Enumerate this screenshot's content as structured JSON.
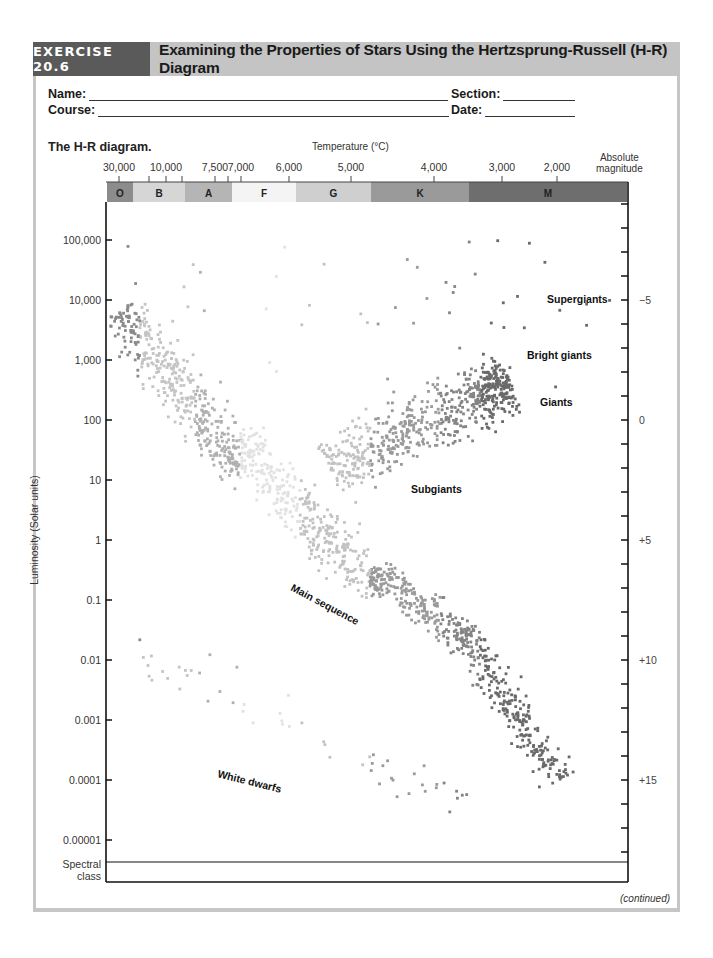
{
  "header": {
    "exercise_tag": "EXERCISE 20.6",
    "title": "Examining the Properties of Stars Using the Hertzsprung-Russell (H-R) Diagram",
    "tag_color": "#5a5a5a",
    "title_bg_color": "#c4c4c4"
  },
  "form": {
    "name_label": "Name:",
    "course_label": "Course:",
    "section_label": "Section:",
    "date_label": "Date:",
    "name_value": "",
    "course_value": "",
    "section_value": "",
    "date_value": ""
  },
  "figure": {
    "subtitle": "The H-R diagram.",
    "temperature_axis_title": "Temperature (°C)",
    "absolute_magnitude_title_line1": "Absolute",
    "absolute_magnitude_title_line2": "magnitude",
    "luminosity_axis_title": "Luminosity (Solar units)",
    "spectral_class_line1": "Spectral",
    "spectral_class_line2": "class",
    "footer_note": "(continued)"
  },
  "chart_data": {
    "type": "scatter",
    "title": "The H-R diagram.",
    "xlabel": "Temperature (°C)",
    "ylabel": "Luminosity (Solar units)",
    "y2label": "Absolute magnitude",
    "y_scale": "log",
    "ylim": [
      5e-06,
      300000
    ],
    "grid": false,
    "temperature_ticks": [
      {
        "label": "30,000",
        "x": 119
      },
      {
        "label": "10,000",
        "x": 166
      },
      {
        "label": "7,500",
        "x": 215
      },
      {
        "label": "7,000",
        "x": 241
      },
      {
        "label": "6,000",
        "x": 289
      },
      {
        "label": "5,000",
        "x": 351
      },
      {
        "label": "4,000",
        "x": 434
      },
      {
        "label": "3,000",
        "x": 502
      },
      {
        "label": "2,000",
        "x": 557
      }
    ],
    "temperature_minor_ticks_x": [
      149,
      182,
      228
    ],
    "spectral_classes": [
      {
        "label": "O",
        "x0": 107,
        "x1": 133,
        "color": "#8c8c8c"
      },
      {
        "label": "B",
        "x0": 133,
        "x1": 185,
        "color": "#d6d6d6"
      },
      {
        "label": "A",
        "x0": 185,
        "x1": 232,
        "color": "#b5b5b5"
      },
      {
        "label": "F",
        "x0": 232,
        "x1": 296,
        "color": "#f4f4f4"
      },
      {
        "label": "G",
        "x0": 296,
        "x1": 371,
        "color": "#cfcfcf"
      },
      {
        "label": "K",
        "x0": 371,
        "x1": 469,
        "color": "#9a9a9a"
      },
      {
        "label": "M",
        "x0": 469,
        "x1": 627,
        "color": "#6e6e6e"
      }
    ],
    "luminosity_ticks": [
      {
        "label": "100,000",
        "value": 100000
      },
      {
        "label": "10,000",
        "value": 10000
      },
      {
        "label": "1,000",
        "value": 1000
      },
      {
        "label": "100",
        "value": 100
      },
      {
        "label": "10",
        "value": 10
      },
      {
        "label": "1",
        "value": 1
      },
      {
        "label": "0.1",
        "value": 0.1
      },
      {
        "label": "0.01",
        "value": 0.01
      },
      {
        "label": "0.001",
        "value": 0.001
      },
      {
        "label": "0.0001",
        "value": 0.0001
      },
      {
        "label": "0.00001",
        "value": 1e-05
      }
    ],
    "magnitude_ticks": [
      {
        "label": "−5",
        "value": -5
      },
      {
        "label": "0",
        "value": 0
      },
      {
        "label": "+5",
        "value": 5
      },
      {
        "label": "+10",
        "value": 10
      },
      {
        "label": "+15",
        "value": 15
      }
    ],
    "magnitude_minor_range": [
      -9,
      18
    ],
    "annotations": [
      {
        "text": "Supergiants",
        "x": 547,
        "y": 303,
        "rotate": 0
      },
      {
        "text": "Bright giants",
        "x": 527,
        "y": 359,
        "rotate": 0
      },
      {
        "text": "Giants",
        "x": 540,
        "y": 406,
        "rotate": 0
      },
      {
        "text": "Subgiants",
        "x": 411,
        "y": 493,
        "rotate": 0
      },
      {
        "text": "Main sequence",
        "x": 290,
        "y": 590,
        "rotate": 28
      },
      {
        "text": "White dwarfs",
        "x": 217,
        "y": 777,
        "rotate": 14
      }
    ],
    "star_regions": [
      {
        "name": "main-sequence-upper",
        "x0": 120,
        "y0": 310,
        "x1": 240,
        "y1": 470,
        "width": 22,
        "count": 420
      },
      {
        "name": "main-sequence-middle",
        "x0": 235,
        "y0": 440,
        "x1": 380,
        "y1": 590,
        "width": 22,
        "count": 380
      },
      {
        "name": "main-sequence-lower",
        "x0": 370,
        "y0": 570,
        "x1": 470,
        "y1": 640,
        "width": 16,
        "count": 230
      },
      {
        "name": "main-sequence-bottom",
        "x0": 460,
        "y0": 630,
        "x1": 560,
        "y1": 780,
        "width": 15,
        "count": 260
      },
      {
        "name": "giant-branch",
        "x0": 330,
        "y0": 470,
        "x1": 510,
        "y1": 385,
        "width": 28,
        "count": 520
      },
      {
        "name": "giant-clump",
        "x0": 470,
        "y0": 395,
        "x1": 510,
        "y1": 380,
        "width": 18,
        "count": 120
      },
      {
        "name": "supergiants-scatter",
        "x0": 115,
        "y0": 240,
        "x1": 620,
        "y1": 400,
        "width": 0,
        "count": 55
      },
      {
        "name": "white-dwarfs",
        "x0": 128,
        "y0": 655,
        "x1": 470,
        "y1": 805,
        "width": 22,
        "count": 55
      }
    ]
  }
}
